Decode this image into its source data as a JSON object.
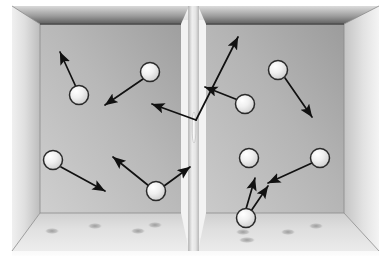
{
  "figure": {
    "type": "physics-illustration",
    "width": 391,
    "height": 263,
    "background": "#ffffff"
  },
  "colors": {
    "background": "#ffffff",
    "outer_box_light": "#f2f2f2",
    "outer_box_mid": "#dcdcdc",
    "wall_back_light": "#cfcfcf",
    "wall_back_dark": "#9a9a9a",
    "wall_side_light": "#e8e8e8",
    "wall_side_dark": "#b4b4b4",
    "ceiling_dark": "#6e6e6e",
    "ceiling_light": "#b9b9b9",
    "floor_light": "#e6e6e6",
    "floor_mid": "#d2d2d2",
    "sphere_fill": "#ededed",
    "sphere_highlight": "#ffffff",
    "sphere_outline": "#2a2a2a",
    "shadow": "#9e9e9e",
    "arrow": "#111111",
    "edge_line": "#6a6a6a",
    "slit": "#f4f4f4"
  },
  "geometry": {
    "outer_frame": {
      "x": 12,
      "y": 6,
      "width": 367,
      "height": 250
    },
    "divider": {
      "x": 188,
      "y": 10,
      "width": 11,
      "height": 245,
      "label": "partition-wall"
    },
    "slit": {
      "x": 192,
      "y": 112,
      "width": 4,
      "height": 31,
      "label": "slit-opening"
    }
  },
  "chambers": [
    {
      "id": "left-chamber",
      "label": "left chamber",
      "x": 12,
      "y": 6,
      "width": 180,
      "height": 250
    },
    {
      "id": "right-chamber",
      "label": "right chamber",
      "x": 196,
      "y": 6,
      "width": 183,
      "height": 250
    }
  ],
  "spheres": [
    {
      "id": "sphere-1",
      "chamber": "left",
      "cx": 79,
      "cy": 95,
      "r": 9.5
    },
    {
      "id": "sphere-2",
      "chamber": "left",
      "cx": 150,
      "cy": 72,
      "r": 9.5
    },
    {
      "id": "sphere-3",
      "chamber": "left",
      "cx": 53,
      "cy": 160,
      "r": 9.5
    },
    {
      "id": "sphere-4",
      "chamber": "left",
      "cx": 156,
      "cy": 191,
      "r": 9.5
    },
    {
      "id": "sphere-5",
      "chamber": "right",
      "cx": 278,
      "cy": 70,
      "r": 9.5
    },
    {
      "id": "sphere-6",
      "chamber": "right",
      "cx": 245,
      "cy": 104,
      "r": 9.5
    },
    {
      "id": "sphere-7",
      "chamber": "right",
      "cx": 249,
      "cy": 158,
      "r": 9.5
    },
    {
      "id": "sphere-8",
      "chamber": "right",
      "cx": 320,
      "cy": 158,
      "r": 9.5
    },
    {
      "id": "sphere-9",
      "chamber": "right",
      "cx": 246,
      "cy": 218,
      "r": 9.5
    }
  ],
  "arrows": [
    {
      "id": "arrow-1",
      "from_sphere": "sphere-1",
      "x1": 76,
      "y1": 87,
      "x2": 60,
      "y2": 52,
      "note": "up-left"
    },
    {
      "id": "arrow-2",
      "from_sphere": "sphere-2",
      "x1": 143,
      "y1": 79,
      "x2": 105,
      "y2": 105,
      "note": "down-left"
    },
    {
      "id": "arrow-3",
      "from_sphere": "sphere-3",
      "x1": 61,
      "y1": 167,
      "x2": 105,
      "y2": 191,
      "note": "down-right"
    },
    {
      "id": "arrow-4",
      "from_sphere": "sphere-4",
      "x1": 149,
      "y1": 186,
      "x2": 113,
      "y2": 157,
      "note": "up-left"
    },
    {
      "id": "arrow-5",
      "from_sphere": "sphere-4",
      "x1": 164,
      "y1": 186,
      "x2": 190,
      "y2": 167,
      "note": "toward-slit"
    },
    {
      "id": "arrow-6",
      "from_sphere": "none",
      "x1": 196,
      "y1": 120,
      "x2": 152,
      "y2": 104,
      "note": "through-slit-to-left"
    },
    {
      "id": "arrow-7",
      "from_sphere": "none",
      "x1": 196,
      "y1": 120,
      "x2": 238,
      "y2": 37,
      "note": "through-slit-up-right"
    },
    {
      "id": "arrow-8",
      "from_sphere": "sphere-5",
      "x1": 285,
      "y1": 78,
      "x2": 312,
      "y2": 117,
      "note": "down-right"
    },
    {
      "id": "arrow-9",
      "from_sphere": "sphere-6",
      "x1": 238,
      "y1": 100,
      "x2": 205,
      "y2": 87,
      "note": "up-left"
    },
    {
      "id": "arrow-10",
      "from_sphere": "sphere-8",
      "x1": 312,
      "y1": 163,
      "x2": 268,
      "y2": 183,
      "note": "down-left"
    },
    {
      "id": "arrow-11",
      "from_sphere": "sphere-9",
      "x1": 246,
      "y1": 209,
      "x2": 255,
      "y2": 178,
      "note": "up"
    },
    {
      "id": "arrow-12",
      "from_sphere": "sphere-9",
      "x1": 251,
      "y1": 211,
      "x2": 268,
      "y2": 186,
      "note": "up-right"
    }
  ],
  "floor_shadows": [
    {
      "id": "shadow-1",
      "cx": 52,
      "cy": 231,
      "rx": 7,
      "ry": 3
    },
    {
      "id": "shadow-2",
      "cx": 95,
      "cy": 226,
      "rx": 7,
      "ry": 3
    },
    {
      "id": "shadow-3",
      "cx": 138,
      "cy": 231,
      "rx": 7,
      "ry": 3
    },
    {
      "id": "shadow-4",
      "cx": 155,
      "cy": 225,
      "rx": 7,
      "ry": 3
    },
    {
      "id": "shadow-5",
      "cx": 243,
      "cy": 232,
      "rx": 7,
      "ry": 3
    },
    {
      "id": "shadow-6",
      "cx": 247,
      "cy": 240,
      "rx": 8,
      "ry": 3
    },
    {
      "id": "shadow-7",
      "cx": 288,
      "cy": 232,
      "rx": 7,
      "ry": 3
    },
    {
      "id": "shadow-8",
      "cx": 316,
      "cy": 226,
      "rx": 7,
      "ry": 3
    }
  ]
}
